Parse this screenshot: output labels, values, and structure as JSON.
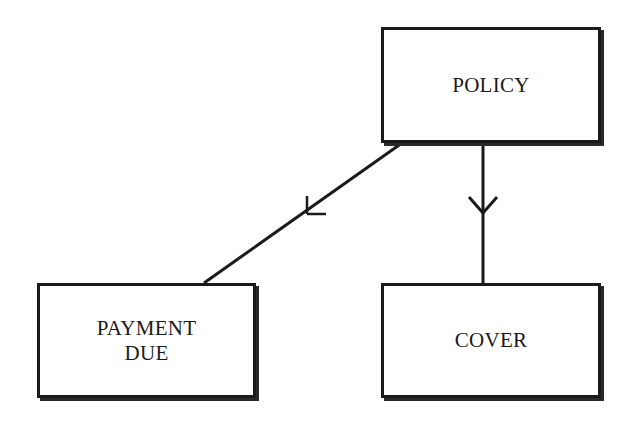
{
  "diagram": {
    "type": "entity-relationship",
    "entities": [
      {
        "id": "policy",
        "label": "POLICY"
      },
      {
        "id": "payment_due",
        "label": "PAYMENT\nDUE"
      },
      {
        "id": "cover",
        "label": "COVER"
      }
    ],
    "relationships": [
      {
        "from": "policy",
        "to": "payment_due",
        "line": "diagonal",
        "marker": "bar-tick"
      },
      {
        "from": "policy",
        "to": "cover",
        "line": "vertical",
        "marker": "crows-foot"
      }
    ],
    "colors": {
      "line": "#1a1a1a",
      "background": "#ffffff"
    }
  }
}
